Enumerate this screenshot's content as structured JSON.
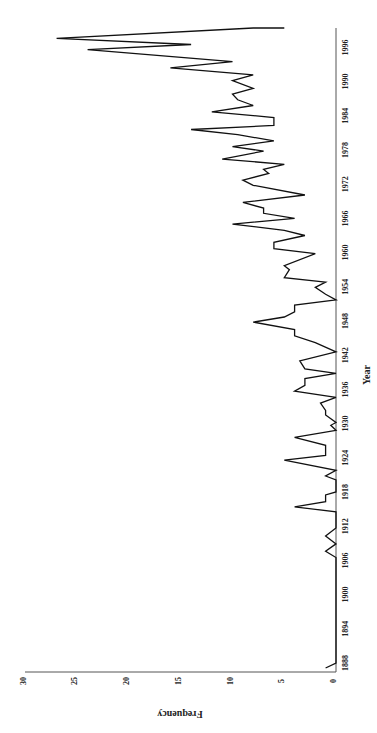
{
  "chart_data": {
    "type": "line",
    "orientation": "rotated-90-clockwise",
    "title": "",
    "xlabel": "Year",
    "ylabel": "Frequency",
    "xticks": [
      1888,
      1894,
      1900,
      1906,
      1912,
      1918,
      1924,
      1930,
      1936,
      1942,
      1948,
      1954,
      1960,
      1966,
      1972,
      1978,
      1984,
      1990,
      1996
    ],
    "yticks": [
      0,
      5,
      10,
      15,
      20,
      25,
      30
    ],
    "xlim": [
      1887,
      1999
    ],
    "ylim": [
      0,
      30
    ],
    "grid": false,
    "legend": null,
    "series": [
      {
        "name": "Frequency",
        "color": "#111111",
        "points": [
          [
            1887.0,
            1
          ],
          [
            1888.0,
            0
          ],
          [
            1906.5,
            0
          ],
          [
            1907.6,
            1
          ],
          [
            1908.9,
            0
          ],
          [
            1910.3,
            1
          ],
          [
            1911.7,
            0
          ],
          [
            1914.5,
            0
          ],
          [
            1915.4,
            4
          ],
          [
            1916.3,
            1
          ],
          [
            1917.5,
            1
          ],
          [
            1918.0,
            0
          ],
          [
            1920.1,
            0
          ],
          [
            1920.8,
            1
          ],
          [
            1921.8,
            0
          ],
          [
            1923.6,
            5
          ],
          [
            1924.4,
            1
          ],
          [
            1926.2,
            1
          ],
          [
            1927.6,
            4
          ],
          [
            1928.8,
            0
          ],
          [
            1929.7,
            0.5
          ],
          [
            1930.2,
            0
          ],
          [
            1931.5,
            1
          ],
          [
            1932.3,
            1
          ],
          [
            1933.6,
            1.5
          ],
          [
            1934.6,
            0
          ],
          [
            1935.7,
            4
          ],
          [
            1936.7,
            3
          ],
          [
            1937.9,
            3
          ],
          [
            1938.8,
            0
          ],
          [
            1939.6,
            3
          ],
          [
            1941.0,
            3.5
          ],
          [
            1942.6,
            0
          ],
          [
            1944.2,
            2
          ],
          [
            1945.4,
            4
          ],
          [
            1946.5,
            4
          ],
          [
            1947.8,
            8
          ],
          [
            1948.7,
            5
          ],
          [
            1949.6,
            4
          ],
          [
            1950.8,
            4
          ],
          [
            1951.7,
            0
          ],
          [
            1952.7,
            1
          ],
          [
            1953.9,
            2
          ],
          [
            1954.8,
            1
          ],
          [
            1955.6,
            5
          ],
          [
            1957.0,
            4.5
          ],
          [
            1957.7,
            5
          ],
          [
            1959.8,
            2
          ],
          [
            1960.7,
            6
          ],
          [
            1961.8,
            6
          ],
          [
            1963.0,
            3
          ],
          [
            1963.9,
            5
          ],
          [
            1965.0,
            10
          ],
          [
            1966.0,
            4
          ],
          [
            1966.9,
            7
          ],
          [
            1967.8,
            7
          ],
          [
            1968.8,
            9
          ],
          [
            1970.1,
            3
          ],
          [
            1971.8,
            8
          ],
          [
            1972.7,
            9
          ],
          [
            1973.9,
            6.5
          ],
          [
            1974.6,
            7
          ],
          [
            1975.5,
            5
          ],
          [
            1976.4,
            11
          ],
          [
            1977.8,
            7
          ],
          [
            1978.6,
            10
          ],
          [
            1979.6,
            6
          ],
          [
            1980.7,
            9.5
          ],
          [
            1981.6,
            14
          ],
          [
            1982.3,
            6
          ],
          [
            1983.7,
            6
          ],
          [
            1984.7,
            12
          ],
          [
            1985.8,
            8
          ],
          [
            1986.8,
            9.5
          ],
          [
            1987.8,
            10
          ],
          [
            1988.8,
            8
          ],
          [
            1990.2,
            10
          ],
          [
            1991.2,
            8
          ],
          [
            1992.4,
            16
          ],
          [
            1993.5,
            10
          ],
          [
            1995.6,
            24
          ],
          [
            1996.5,
            14
          ],
          [
            1997.6,
            27
          ],
          [
            1999.8,
            8
          ],
          [
            2000.5,
            6
          ],
          [
            2001.7,
            5
          ]
        ]
      }
    ],
    "approx_annual_values": {
      "1887": 1,
      "1888-1906": 0,
      "1915": 4,
      "1923": 5,
      "1927": 4,
      "1935": 4,
      "1947": 8,
      "1955": 5,
      "1960": 6,
      "1965": 10,
      "1968": 9,
      "1976": 11,
      "1981": 14,
      "1984": 12,
      "1988": 16,
      "1991": 24,
      "1992": 14,
      "1993": 27,
      "1996": 8,
      "1997": 6,
      "1998": 5
    }
  },
  "labels": {
    "x_title": "Year",
    "y_title": "Frequency"
  }
}
